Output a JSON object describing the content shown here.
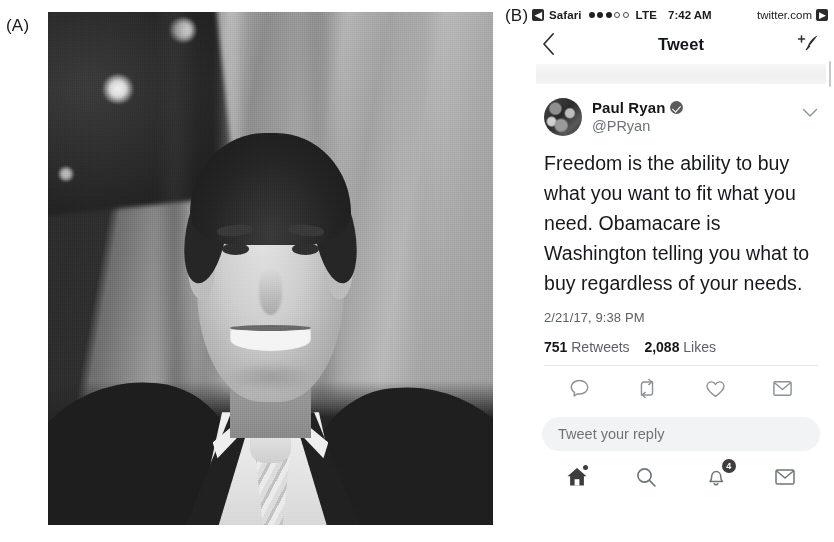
{
  "figure": {
    "panel_a_label": "(A)",
    "panel_b_label": "(B)"
  },
  "photo": {
    "alt_name": "paul-ryan-official-portrait",
    "description": "Black and white official portrait of a smiling man in a dark suit, white shirt and light striped tie, standing in front of American flags"
  },
  "phone": {
    "status_bar": {
      "back_app_icon": "back-arrow-icon",
      "back_app": "Safari",
      "signal_dots_filled": 3,
      "signal_dots_empty": 2,
      "carrier_tech": "LTE",
      "time": "7:42 AM",
      "site": "twitter.com",
      "forward_icon": "forward-arrow-icon"
    },
    "nav_bar": {
      "back_icon": "chevron-left-icon",
      "title": "Tweet",
      "compose_icon": "compose-quill-icon"
    },
    "tweet": {
      "avatar_icon": "avatar",
      "display_name": "Paul Ryan",
      "verified_icon": "verified-badge-icon",
      "handle": "@PRyan",
      "more_icon": "chevron-down-icon",
      "text": "Freedom is the ability to buy what you want to fit what you need. Obamacare is Washington telling you what to buy regardless of your needs.",
      "timestamp": "2/21/17, 9:38 PM",
      "retweets_count": "751",
      "retweets_label": "Retweets",
      "likes_count": "2,088",
      "likes_label": "Likes"
    },
    "actions": [
      {
        "name": "reply-icon",
        "label": "Reply"
      },
      {
        "name": "retweet-icon",
        "label": "Retweet"
      },
      {
        "name": "like-icon",
        "label": "Like"
      },
      {
        "name": "share-icon",
        "label": "Share"
      }
    ],
    "reply_box": {
      "placeholder": "Tweet your reply"
    },
    "tab_bar": [
      {
        "name": "home-icon",
        "label": "Home",
        "badge": ""
      },
      {
        "name": "search-icon",
        "label": "Search",
        "badge": ""
      },
      {
        "name": "notifications-icon",
        "label": "Notifications",
        "badge": "4"
      },
      {
        "name": "messages-icon",
        "label": "Messages",
        "badge": ""
      }
    ]
  },
  "colors": {
    "text_primary": "#14171a",
    "text_secondary": "#6b7177",
    "icon_grey": "#7c8287",
    "divider": "#e4e6e8",
    "reply_box_bg": "#f2f3f4",
    "badge_bg": "#3d3d3d"
  }
}
